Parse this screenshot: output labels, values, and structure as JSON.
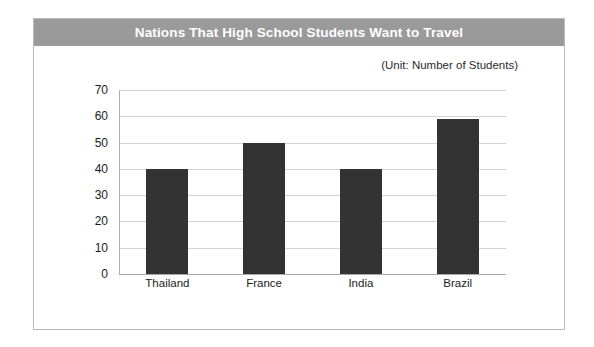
{
  "figure": {
    "title": "Nations That High School Students Want to Travel",
    "unit_note": "(Unit: Number of Students)",
    "banner_color": "#9a9a9a",
    "bar_color": "#333333",
    "title_text_color": "#ffffff",
    "frame_border_color": "#b9b9b9",
    "gridline_color": "#d3d3d3"
  },
  "chart_data": {
    "type": "bar",
    "title": "Nations That High School Students Want to Travel",
    "subtitle": "(Unit: Number of Students)",
    "categories": [
      "Thailand",
      "France",
      "India",
      "Brazil"
    ],
    "values": [
      40,
      50,
      40,
      59
    ],
    "series": [
      {
        "name": "Number of Students",
        "values": [
          40,
          50,
          40,
          59
        ]
      }
    ],
    "xlabel": "",
    "ylabel": "",
    "ylim": [
      0,
      70
    ],
    "yticks": [
      0,
      10,
      20,
      30,
      40,
      50,
      60,
      70
    ],
    "ytick_labels": [
      "0",
      "10",
      "20",
      "30",
      "40",
      "50",
      "60",
      "70"
    ],
    "grid": true,
    "grid_axis": "y",
    "legend": false,
    "legend_position": "none",
    "bar_color": "#333333",
    "annotations": []
  }
}
